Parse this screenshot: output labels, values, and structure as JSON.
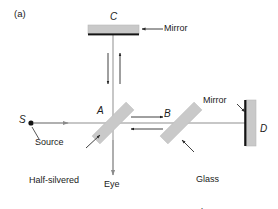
{
  "figure": {
    "panel_label": "(a)",
    "type": "optics-ray-diagram",
    "name": "Michelson interferometer"
  },
  "labels": {
    "panel": "(a)",
    "mirror_c": "C",
    "mirror_c_callout": "Mirror",
    "beamsplitter_a": "A",
    "glass_plate_b": "B",
    "mirror_d": "D",
    "mirror_d_callout": "Mirror",
    "source_point": "S",
    "source_text": "Source",
    "half_silvered": "Half-silvered\nmirror",
    "half_silvered_line1": "Half-silvered",
    "half_silvered_line2": "mirror",
    "glass_plate_text": "Glass\nplate",
    "glass_plate_line1": "Glass",
    "glass_plate_line2": "plate",
    "eye": "Eye"
  },
  "colors": {
    "line": "#6e6e6e",
    "dark_line": "#1a1a1a",
    "optic_fill": "#c9c9c9",
    "optic_stroke": "#b4b4b4",
    "mirror_backing": "#111111",
    "text": "#1a1a1a",
    "background": "#ffffff"
  },
  "components": [
    {
      "id": "C",
      "kind": "mirror",
      "orientation": "horizontal",
      "label": "C"
    },
    {
      "id": "A",
      "kind": "half-silvered-mirror",
      "orientation": "45deg",
      "label": "A"
    },
    {
      "id": "B",
      "kind": "glass-plate",
      "orientation": "45deg",
      "label": "B"
    },
    {
      "id": "D",
      "kind": "mirror",
      "orientation": "vertical",
      "label": "D"
    },
    {
      "id": "S",
      "kind": "source",
      "orientation": "point",
      "label": "S"
    }
  ],
  "beam_arrows": [
    {
      "id": "vertical-down",
      "direction": "down",
      "segment": "A-to-C"
    },
    {
      "id": "vertical-up",
      "direction": "up",
      "segment": "C-to-A"
    },
    {
      "id": "horizontal-right",
      "direction": "right",
      "segment": "A-to-B"
    },
    {
      "id": "horizontal-left",
      "direction": "left",
      "segment": "B-to-A"
    },
    {
      "id": "source-right",
      "direction": "right",
      "segment": "S-to-A"
    },
    {
      "id": "eye-down",
      "direction": "down",
      "segment": "A-to-Eye"
    }
  ]
}
